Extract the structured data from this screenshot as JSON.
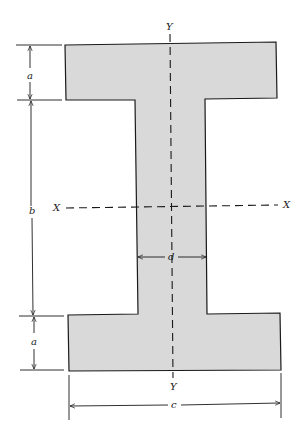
{
  "diagram": {
    "type": "I-beam cross-section",
    "axes": {
      "vertical_top": "Y",
      "vertical_bottom": "Y",
      "horizontal_left": "X",
      "horizontal_right": "X"
    },
    "dimensions": {
      "top_flange_thickness": "a",
      "web_height": "b",
      "bottom_flange_thickness": "a",
      "web_width": "d",
      "overall_width": "c"
    },
    "colors": {
      "fill": "#d9d9d9",
      "stroke": "#1a1a1a",
      "background": "#ffffff"
    }
  }
}
